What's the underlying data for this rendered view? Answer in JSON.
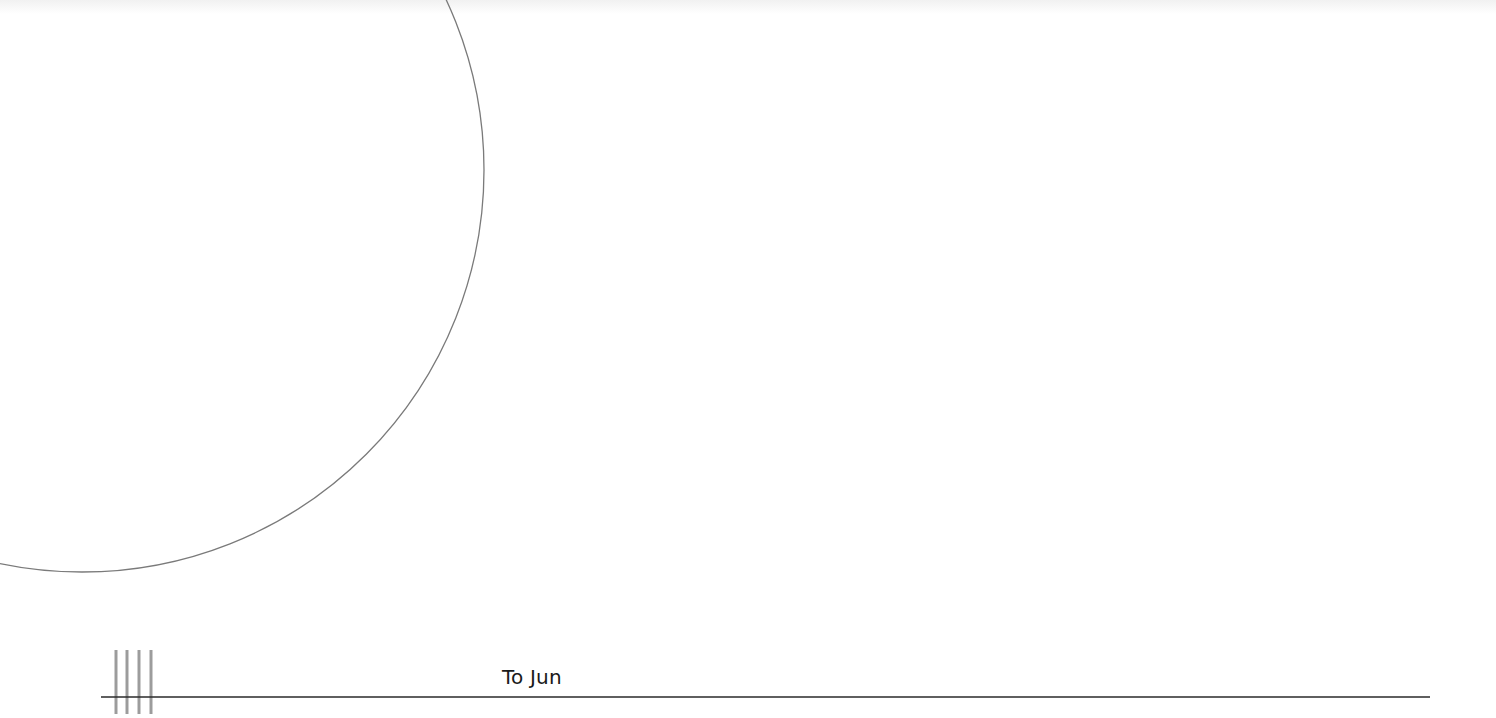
{
  "document": {
    "label_text": "To Jun",
    "colors": {
      "background": "#ffffff",
      "circle_stroke": "#7a7a7a",
      "rule_stroke": "#2a2a2a",
      "tally_stroke": "#9c9c9c",
      "text": "#1a1a1a"
    },
    "shapes": {
      "circle": {
        "cx": 82,
        "cy": 170,
        "r": 402
      },
      "rule": {
        "x1": 101,
        "y1": 697,
        "x2": 1430,
        "y2": 697
      },
      "tally_marks": [
        {
          "x": 116,
          "y1": 650,
          "y2": 714
        },
        {
          "x": 127,
          "y1": 650,
          "y2": 714
        },
        {
          "x": 139,
          "y1": 650,
          "y2": 714
        },
        {
          "x": 151,
          "y1": 650,
          "y2": 714
        }
      ]
    }
  }
}
